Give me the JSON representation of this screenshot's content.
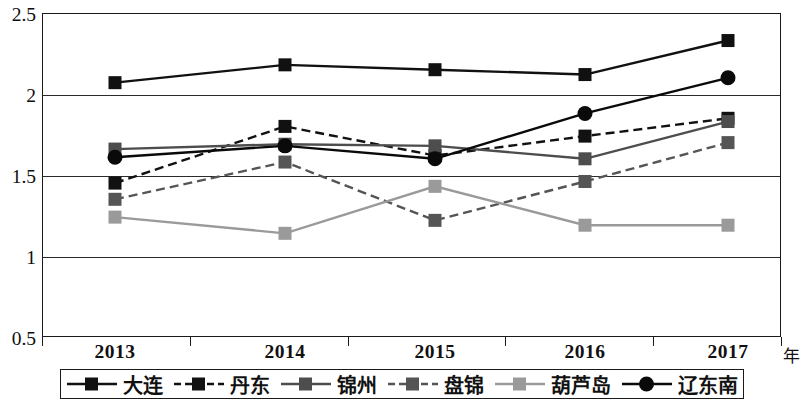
{
  "chart_data": {
    "type": "line",
    "title": "",
    "xlabel": "年",
    "ylabel": "",
    "categories": [
      "2013",
      "2014",
      "2015",
      "2016",
      "2017"
    ],
    "ylim": [
      0.5,
      2.5
    ],
    "yticks": [
      "0.5",
      "1",
      "1.5",
      "2",
      "2.5"
    ],
    "ytick_values": [
      0.5,
      1,
      1.5,
      2,
      2.5
    ],
    "grid": "horizontal",
    "legend_position": "bottom",
    "series": [
      {
        "name": "大连",
        "values": [
          2.07,
          2.18,
          2.15,
          2.12,
          2.33
        ],
        "color": "#111111",
        "dash": "solid",
        "marker": "square"
      },
      {
        "name": "丹东",
        "values": [
          1.45,
          1.8,
          1.62,
          1.74,
          1.85
        ],
        "color": "#111111",
        "dash": "dashed",
        "marker": "square"
      },
      {
        "name": "锦州",
        "values": [
          1.66,
          1.69,
          1.68,
          1.6,
          1.83
        ],
        "color": "#4d4d4d",
        "dash": "solid",
        "marker": "square"
      },
      {
        "name": "盘锦",
        "values": [
          1.35,
          1.58,
          1.22,
          1.46,
          1.7
        ],
        "color": "#555555",
        "dash": "dashed",
        "marker": "square"
      },
      {
        "name": "葫芦岛",
        "values": [
          1.24,
          1.14,
          1.43,
          1.19,
          1.19
        ],
        "color": "#9a9a9a",
        "dash": "solid",
        "marker": "square"
      },
      {
        "name": "辽东南",
        "values": [
          1.61,
          1.68,
          1.6,
          1.88,
          2.1
        ],
        "color": "#0a0a0a",
        "dash": "solid",
        "marker": "circle"
      }
    ]
  },
  "axis": {
    "x_title": "年"
  },
  "legend": {
    "items": [
      {
        "label": "大连"
      },
      {
        "label": "丹东"
      },
      {
        "label": "锦州"
      },
      {
        "label": "盘锦"
      },
      {
        "label": "葫芦岛"
      },
      {
        "label": "辽东南"
      }
    ]
  }
}
